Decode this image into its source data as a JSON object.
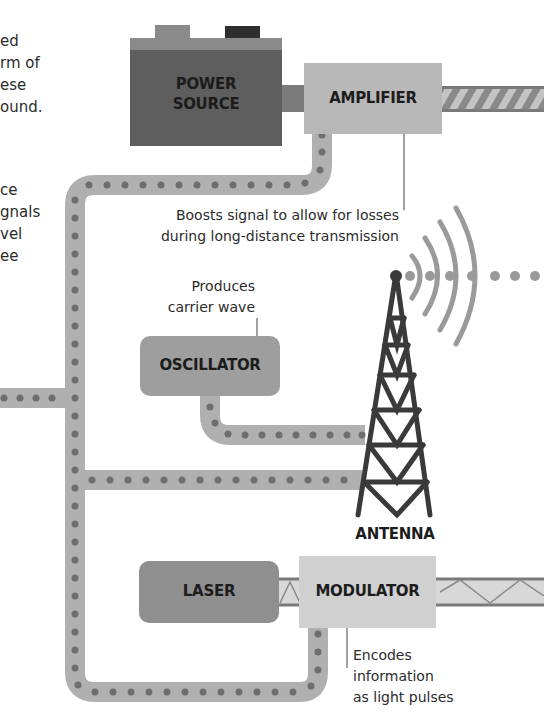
{
  "intro": {
    "para1": [
      "ed",
      "rm of",
      "ese",
      "ound."
    ],
    "para2": [
      "ce",
      "gnals",
      "vel",
      "ee"
    ]
  },
  "components": {
    "power_source": {
      "line1": "POWER",
      "line2": "SOURCE"
    },
    "amplifier": {
      "label": "AMPLIFIER"
    },
    "oscillator": {
      "label": "OSCILLATOR"
    },
    "antenna": {
      "label": "ANTENNA"
    },
    "laser": {
      "label": "LASER"
    },
    "modulator": {
      "label": "MODULATOR"
    }
  },
  "annotations": {
    "amplifier_note": [
      "Boosts signal to allow for losses",
      "during long-distance transmission"
    ],
    "oscillator_note": [
      "Produces",
      "carrier wave"
    ],
    "modulator_note": [
      "Encodes",
      "information",
      "as light pulses"
    ]
  },
  "colors": {
    "power_source_body": "#5e5e5e",
    "power_source_top": "#8a8a8a",
    "amplifier": "#b8b8b8",
    "oscillator": "#9e9e9e",
    "laser": "#8f8f8f",
    "modulator": "#d0d0d0",
    "cable": "#b0b0b0",
    "cable_dot": "#6e6e6e",
    "tower": "#3a3a3a",
    "wave": "#9a9a9a"
  }
}
